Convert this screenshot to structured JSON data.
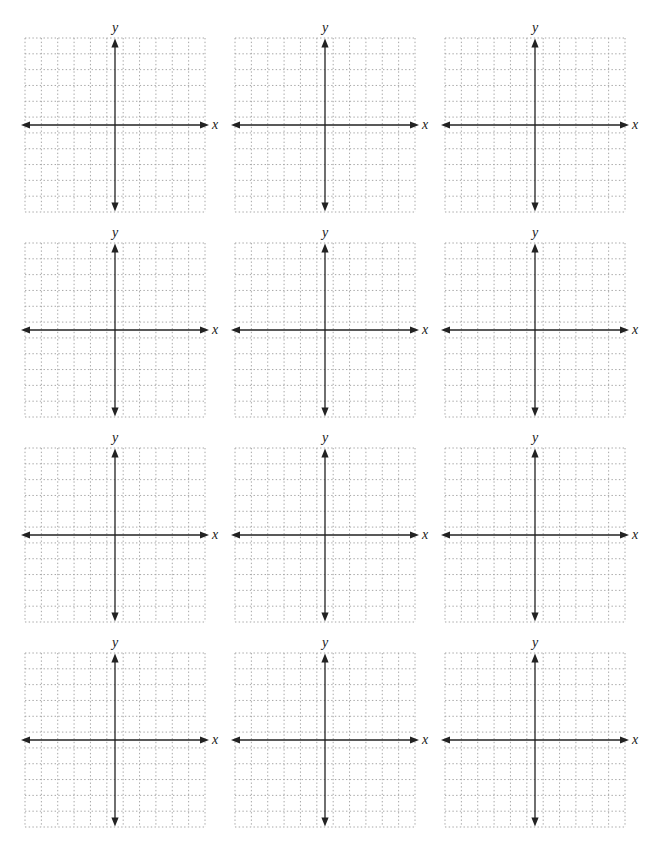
{
  "page": {
    "colors": {
      "paper": "#ffffff",
      "gridline": "#a6a6a6",
      "axis": "#222222",
      "label": "#1a1a1a"
    },
    "layout_hints": {
      "rows": 4,
      "columns": 3,
      "cells_per_side": 11,
      "grid_style": "dotted"
    },
    "plots": [
      {
        "x_label": "x",
        "y_label": "y"
      },
      {
        "x_label": "x",
        "y_label": "y"
      },
      {
        "x_label": "x",
        "y_label": "y"
      },
      {
        "x_label": "x",
        "y_label": "y"
      },
      {
        "x_label": "x",
        "y_label": "y"
      },
      {
        "x_label": "x",
        "y_label": "y"
      },
      {
        "x_label": "x",
        "y_label": "y"
      },
      {
        "x_label": "x",
        "y_label": "y"
      },
      {
        "x_label": "x",
        "y_label": "y"
      },
      {
        "x_label": "x",
        "y_label": "y"
      },
      {
        "x_label": "x",
        "y_label": "y"
      },
      {
        "x_label": "x",
        "y_label": "y"
      }
    ]
  }
}
